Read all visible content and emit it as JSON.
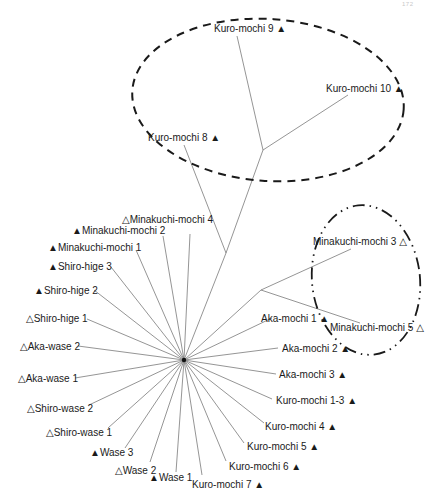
{
  "page_number": "172",
  "diagram": {
    "type": "unrooted-phylogenetic-tree",
    "hub": {
      "x": 184,
      "y": 360
    },
    "markers": {
      "filled": "▲",
      "open": "△"
    },
    "internal_nodes": [
      {
        "id": "n_upper",
        "x": 226,
        "y": 253
      },
      {
        "id": "n_top",
        "x": 263,
        "y": 150
      },
      {
        "id": "n_right",
        "x": 261,
        "y": 290
      }
    ],
    "internal_edges": [
      {
        "from": "hub",
        "to": "n_upper"
      },
      {
        "from": "n_upper",
        "to": "n_top"
      },
      {
        "from": "hub",
        "to": "n_right"
      }
    ],
    "leaves": [
      {
        "name": "Kuro-mochi 9",
        "marker": "▲",
        "marker_side": "after",
        "from": "n_top",
        "end": {
          "x": 237,
          "y": 36
        },
        "label_x": 214,
        "label_y": 32,
        "anchor": "start"
      },
      {
        "name": "Kuro-mochi 10",
        "marker": "▲",
        "marker_side": "after",
        "from": "n_top",
        "end": {
          "x": 348,
          "y": 95
        },
        "label_x": 326,
        "label_y": 92,
        "anchor": "start"
      },
      {
        "name": "Kuro-mochi 8",
        "marker": "▲",
        "marker_side": "after",
        "from": "n_upper",
        "end": {
          "x": 184,
          "y": 145
        },
        "label_x": 148,
        "label_y": 141,
        "anchor": "start"
      },
      {
        "name": "Minakuchi-mochi 3",
        "marker": "△",
        "marker_side": "after",
        "from": "n_right",
        "end": {
          "x": 351,
          "y": 249
        },
        "label_x": 313,
        "label_y": 245,
        "anchor": "start"
      },
      {
        "name": "Minakuchi-mochi 5",
        "marker": "△",
        "marker_side": "after",
        "from": "n_right",
        "end": {
          "x": 360,
          "y": 323
        },
        "label_x": 330,
        "label_y": 331,
        "anchor": "start"
      },
      {
        "name": "Minakuchi-mochi 4",
        "marker": "△",
        "marker_side": "before",
        "from": "hub",
        "end": {
          "x": 190,
          "y": 234
        },
        "label_x": 122,
        "label_y": 223,
        "anchor": "start"
      },
      {
        "name": "Minakuchi-mochi 2",
        "marker": "▲",
        "marker_side": "before",
        "from": "hub",
        "end": {
          "x": 163,
          "y": 236
        },
        "label_x": 72,
        "label_y": 234,
        "anchor": "start"
      },
      {
        "name": "Minakuchi-mochi 1",
        "marker": "▲",
        "marker_side": "before",
        "from": "hub",
        "end": {
          "x": 136,
          "y": 250
        },
        "label_x": 48,
        "label_y": 251,
        "anchor": "start"
      },
      {
        "name": "Shiro-hige 3",
        "marker": "▲",
        "marker_side": "before",
        "from": "hub",
        "end": {
          "x": 111,
          "y": 267
        },
        "label_x": 48,
        "label_y": 270,
        "anchor": "start"
      },
      {
        "name": "Shiro-hige 2",
        "marker": "▲",
        "marker_side": "before",
        "from": "hub",
        "end": {
          "x": 94,
          "y": 290
        },
        "label_x": 34,
        "label_y": 294,
        "anchor": "start"
      },
      {
        "name": "Shiro-hige 1",
        "marker": "△",
        "marker_side": "before",
        "from": "hub",
        "end": {
          "x": 87,
          "y": 319
        },
        "label_x": 26,
        "label_y": 322,
        "anchor": "start"
      },
      {
        "name": "Aka-wase 2",
        "marker": "△",
        "marker_side": "before",
        "from": "hub",
        "end": {
          "x": 78,
          "y": 346
        },
        "label_x": 20,
        "label_y": 350,
        "anchor": "start"
      },
      {
        "name": "Aka-wase 1",
        "marker": "△",
        "marker_side": "before",
        "from": "hub",
        "end": {
          "x": 75,
          "y": 378
        },
        "label_x": 18,
        "label_y": 382,
        "anchor": "start"
      },
      {
        "name": "Shiro-wase 2",
        "marker": "△",
        "marker_side": "before",
        "from": "hub",
        "end": {
          "x": 89,
          "y": 405
        },
        "label_x": 27,
        "label_y": 412,
        "anchor": "start"
      },
      {
        "name": "Shiro-wase 1",
        "marker": "△",
        "marker_side": "before",
        "from": "hub",
        "end": {
          "x": 108,
          "y": 428
        },
        "label_x": 46,
        "label_y": 436,
        "anchor": "start"
      },
      {
        "name": "Wase 3",
        "marker": "▲",
        "marker_side": "before",
        "from": "hub",
        "end": {
          "x": 125,
          "y": 448
        },
        "label_x": 90,
        "label_y": 456,
        "anchor": "start"
      },
      {
        "name": "Wase 2",
        "marker": "△",
        "marker_side": "before",
        "from": "hub",
        "end": {
          "x": 150,
          "y": 462
        },
        "label_x": 115,
        "label_y": 474,
        "anchor": "start"
      },
      {
        "name": "Wase 1",
        "marker": "▲",
        "marker_side": "before",
        "from": "hub",
        "end": {
          "x": 176,
          "y": 472
        },
        "label_x": 149,
        "label_y": 481,
        "anchor": "start"
      },
      {
        "name": "Kuro-mochi 7",
        "marker": "▲",
        "marker_side": "after",
        "from": "hub",
        "end": {
          "x": 202,
          "y": 475
        },
        "label_x": 192,
        "label_y": 488,
        "anchor": "start"
      },
      {
        "name": "Kuro-mochi 6",
        "marker": "▲",
        "marker_side": "after",
        "from": "hub",
        "end": {
          "x": 226,
          "y": 461
        },
        "label_x": 229,
        "label_y": 470,
        "anchor": "start"
      },
      {
        "name": "Kuro-mochi 5",
        "marker": "▲",
        "marker_side": "after",
        "from": "hub",
        "end": {
          "x": 244,
          "y": 443
        },
        "label_x": 247,
        "label_y": 450,
        "anchor": "start"
      },
      {
        "name": "Kuro-mochi 4",
        "marker": "▲",
        "marker_side": "after",
        "from": "hub",
        "end": {
          "x": 264,
          "y": 423
        },
        "label_x": 265,
        "label_y": 430,
        "anchor": "start"
      },
      {
        "name": "Kuro-mochi 1-3",
        "marker": "▲",
        "marker_side": "after",
        "from": "hub",
        "end": {
          "x": 272,
          "y": 399
        },
        "label_x": 276,
        "label_y": 404,
        "anchor": "start"
      },
      {
        "name": "Aka-mochi 3",
        "marker": "▲",
        "marker_side": "after",
        "from": "hub",
        "end": {
          "x": 276,
          "y": 374
        },
        "label_x": 279,
        "label_y": 378,
        "anchor": "start"
      },
      {
        "name": "Aka-mochi 2",
        "marker": "▲",
        "marker_side": "after",
        "from": "hub",
        "end": {
          "x": 278,
          "y": 348
        },
        "label_x": 282,
        "label_y": 352,
        "anchor": "start"
      },
      {
        "name": "Aka-mochi 1",
        "marker": "▲",
        "marker_side": "after",
        "from": "hub",
        "end": {
          "x": 272,
          "y": 318
        },
        "label_x": 261,
        "label_y": 322,
        "anchor": "start"
      }
    ],
    "groupings": [
      {
        "name": "top-cluster",
        "style": "dashed",
        "cx": 268,
        "cy": 100,
        "rx": 136,
        "ry": 81,
        "rotate": 4
      },
      {
        "name": "right-cluster",
        "style": "dash-dot",
        "cx": 366,
        "cy": 280,
        "rx": 54,
        "ry": 75,
        "rotate": -6
      }
    ]
  }
}
